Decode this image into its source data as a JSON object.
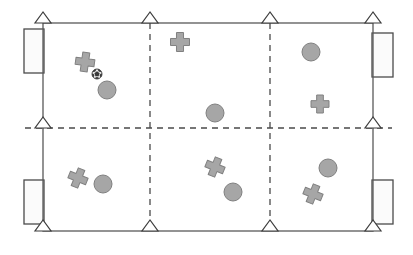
{
  "diagram": {
    "type": "sports-field-schematic",
    "canvas": {
      "width": 413,
      "height": 255
    },
    "colors": {
      "line": "#595959",
      "line_dark": "#3d3d3d",
      "dashed_line": "#4a4a4a",
      "shape_fill": "#a6a6a6",
      "shape_stroke": "#808080",
      "goal_fill": "#fbfbfb",
      "goal_stroke": "#4a4a4a",
      "marker_fill": "#ffffff",
      "marker_stroke": "#3d3d3d",
      "background": "#ffffff",
      "ball_dark": "#3a3a3a",
      "ball_light": "#e8e8e8"
    },
    "field": {
      "label": "field-boundary",
      "x": 43,
      "y": 23,
      "width": 330,
      "height": 208,
      "stroke_width": 1.3
    },
    "dashed_lines": [
      {
        "name": "vertical-third-line-left",
        "x1": 150,
        "y1": 23,
        "x2": 150,
        "y2": 231
      },
      {
        "name": "vertical-third-line-right",
        "x1": 270,
        "y1": 23,
        "x2": 270,
        "y2": 231
      },
      {
        "name": "horizontal-midline",
        "x1": 25,
        "y1": 128,
        "x2": 392,
        "y2": 128
      }
    ],
    "cone_markers": [
      {
        "name": "cone-top-left",
        "x": 43,
        "y": 23
      },
      {
        "name": "cone-top-third-left",
        "x": 150,
        "y": 23
      },
      {
        "name": "cone-top-third-right",
        "x": 270,
        "y": 23
      },
      {
        "name": "cone-top-right",
        "x": 373,
        "y": 23
      },
      {
        "name": "cone-mid-left",
        "x": 43,
        "y": 128
      },
      {
        "name": "cone-mid-right",
        "x": 373,
        "y": 128
      },
      {
        "name": "cone-bottom-left",
        "x": 43,
        "y": 231
      },
      {
        "name": "cone-bottom-third-left",
        "x": 150,
        "y": 231
      },
      {
        "name": "cone-bottom-third-right",
        "x": 270,
        "y": 231
      },
      {
        "name": "cone-bottom-right",
        "x": 373,
        "y": 231
      }
    ],
    "goals": [
      {
        "name": "goal-top-left",
        "x": 24,
        "y": 29,
        "width": 20,
        "height": 44
      },
      {
        "name": "goal-bottom-left",
        "x": 24,
        "y": 180,
        "width": 20,
        "height": 44
      },
      {
        "name": "goal-top-right",
        "x": 372,
        "y": 33,
        "width": 21,
        "height": 44
      },
      {
        "name": "goal-bottom-right",
        "x": 372,
        "y": 180,
        "width": 21,
        "height": 44
      }
    ],
    "players_circle": [
      {
        "name": "player-circle-top-left",
        "cx": 107,
        "cy": 90,
        "r": 9
      },
      {
        "name": "player-circle-center",
        "cx": 215,
        "cy": 113,
        "r": 9
      },
      {
        "name": "player-circle-top-right",
        "cx": 311,
        "cy": 52,
        "r": 9
      },
      {
        "name": "player-circle-bottom-left",
        "cx": 103,
        "cy": 184,
        "r": 9
      },
      {
        "name": "player-circle-bottom-middle",
        "cx": 233,
        "cy": 192,
        "r": 9
      },
      {
        "name": "player-circle-bottom-right",
        "cx": 328,
        "cy": 168,
        "r": 9
      }
    ],
    "players_cross": [
      {
        "name": "player-cross-top-left",
        "cx": 85,
        "cy": 62,
        "size": 19,
        "rotation": 8
      },
      {
        "name": "player-cross-top-middle",
        "cx": 180,
        "cy": 42,
        "size": 19,
        "rotation": 0
      },
      {
        "name": "player-cross-top-right",
        "cx": 320,
        "cy": 104,
        "size": 18,
        "rotation": 0
      },
      {
        "name": "player-cross-bottom-left",
        "cx": 78,
        "cy": 178,
        "size": 19,
        "rotation": 22
      },
      {
        "name": "player-cross-bottom-middle",
        "cx": 215,
        "cy": 167,
        "size": 19,
        "rotation": 22
      },
      {
        "name": "player-cross-bottom-right",
        "cx": 313,
        "cy": 194,
        "size": 19,
        "rotation": 22
      }
    ],
    "ball": {
      "name": "soccer-ball",
      "cx": 97,
      "cy": 74,
      "r": 5
    },
    "legend": {
      "circle_label": "player-circle",
      "cross_label": "player-cross",
      "cone_label": "cone-marker",
      "goal_label": "goal",
      "ball_label": "soccer ball"
    }
  }
}
